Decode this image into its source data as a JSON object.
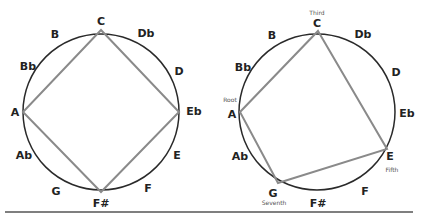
{
  "diagrams": [
    {
      "name": "diminished-seventh",
      "notes": {
        "C": "C",
        "Db": "Db",
        "D": "D",
        "Eb": "Eb",
        "E": "E",
        "F": "F",
        "Fs": "F#",
        "G": "G",
        "Ab": "Ab",
        "A": "A",
        "Bb": "Bb",
        "B": "B"
      },
      "polygon": [
        "A",
        "C",
        "Eb",
        "F#"
      ]
    },
    {
      "name": "minor-seventh",
      "notes": {
        "C": "C",
        "Db": "Db",
        "D": "D",
        "Eb": "Eb",
        "E": "E",
        "F": "F",
        "Fs": "F#",
        "G": "G",
        "Ab": "Ab",
        "A": "A",
        "Bb": "Bb",
        "B": "B"
      },
      "polygon": [
        "A",
        "C",
        "E",
        "G"
      ],
      "roles": {
        "root": "Root",
        "third": "Third",
        "fifth": "Fifth",
        "seventh": "Seventh"
      }
    }
  ],
  "colors": {
    "circle": "#2a2a2a",
    "polygon": "#8a8a8a",
    "rule": "#555555"
  }
}
